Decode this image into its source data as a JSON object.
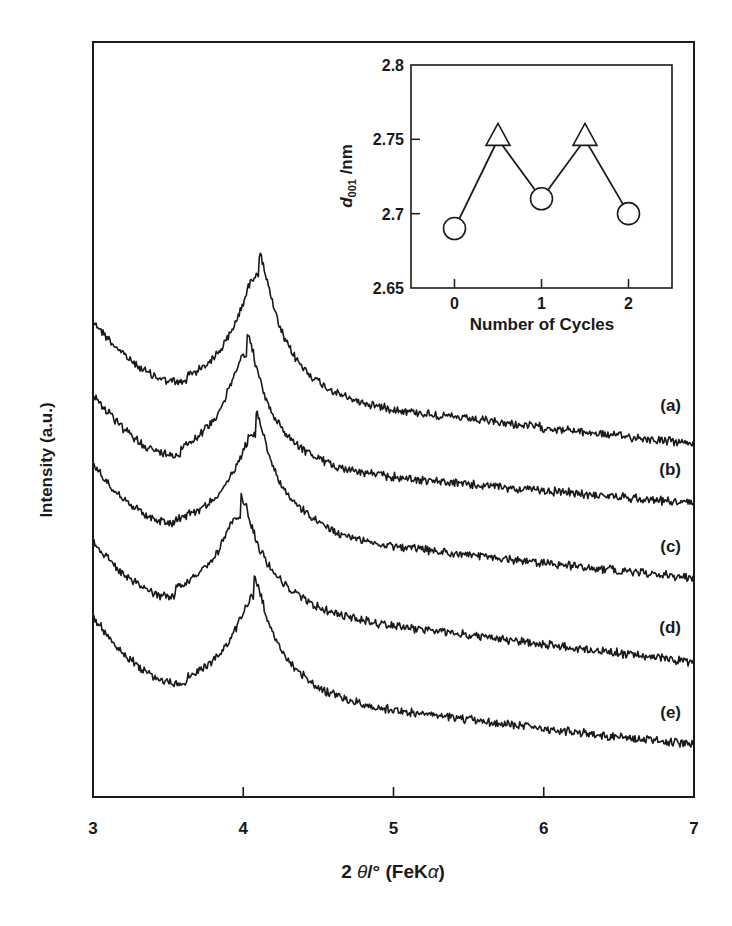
{
  "chart_data": [
    {
      "id": "main",
      "type": "line",
      "title": "",
      "xlabel": "2 θ/° (FeKα)",
      "xlabel_parts": {
        "prefix": "2 ",
        "theta": "θ",
        "deg": "/° ",
        "paren_open": "(FeK",
        "alpha": "α",
        "paren_close": ")"
      },
      "ylabel": "Intensity (a.u.)",
      "xlim": [
        3,
        7
      ],
      "xticks": [
        3,
        4,
        5,
        6,
        7
      ],
      "xtick_labels": [
        "3",
        "4",
        "5",
        "6",
        "7"
      ],
      "yticks": [],
      "grid": false,
      "legend": "inline labels at right end of each curve",
      "series": [
        {
          "name": "(a)",
          "label": "(a)",
          "start_y": 322,
          "min_x": 3.62,
          "min_y": 390,
          "peak_x": 4.1,
          "peak_y": 268,
          "end_y": 444,
          "peak_width": 0.12,
          "label_y": 411
        },
        {
          "name": "(b)",
          "label": "(b)",
          "start_y": 395,
          "min_x": 3.58,
          "min_y": 462,
          "peak_x": 4.02,
          "peak_y": 355,
          "end_y": 503,
          "peak_width": 0.11,
          "label_y": 475
        },
        {
          "name": "(c)",
          "label": "(c)",
          "start_y": 465,
          "min_x": 3.55,
          "min_y": 527,
          "peak_x": 4.08,
          "peak_y": 433,
          "end_y": 578,
          "peak_width": 0.11,
          "label_y": 552
        },
        {
          "name": "(d)",
          "label": "(d)",
          "start_y": 542,
          "min_x": 3.55,
          "min_y": 602,
          "peak_x": 3.98,
          "peak_y": 519,
          "end_y": 662,
          "peak_width": 0.11,
          "label_y": 633
        },
        {
          "name": "(e)",
          "label": "(e)",
          "start_y": 618,
          "min_x": 3.62,
          "min_y": 690,
          "peak_x": 4.07,
          "peak_y": 601,
          "end_y": 745,
          "peak_width": 0.11,
          "label_y": 718
        }
      ]
    },
    {
      "id": "inset",
      "type": "line",
      "title": "",
      "xlabel": "Number of Cycles",
      "ylabel": "d001 /nm",
      "ylabel_parts": {
        "d": "d",
        "sub": "001",
        "unit": " /nm"
      },
      "xlim": [
        -0.5,
        2.5
      ],
      "ylim": [
        2.65,
        2.8
      ],
      "xticks": [
        0,
        1,
        2
      ],
      "xtick_labels": [
        "0",
        "1",
        "2"
      ],
      "yticks": [
        2.65,
        2.7,
        2.75,
        2.8
      ],
      "ytick_labels": [
        "2.65",
        "2.7",
        "2.75",
        "2.8"
      ],
      "grid": false,
      "x": [
        0,
        0.5,
        1,
        1.5,
        2
      ],
      "values": [
        2.69,
        2.75,
        2.71,
        2.75,
        2.7
      ],
      "markers": [
        "circle",
        "triangle",
        "circle",
        "triangle",
        "circle"
      ]
    }
  ],
  "colors": {
    "ink": "#1a1a1a",
    "background": "#ffffff"
  }
}
